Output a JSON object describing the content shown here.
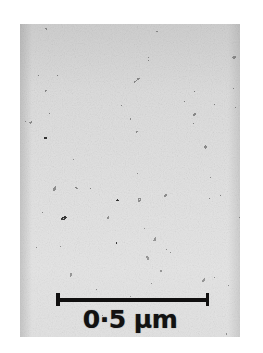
{
  "figure": {
    "kind": "electron-micrograph",
    "clipped_header_text": "",
    "plate": {
      "left": 20,
      "top": 24,
      "width": 220,
      "height": 313,
      "base_gray": "#b9b9b9",
      "grain_fill": "#c8c8c8",
      "boundary_color": "#3a3a3a",
      "precipitate_color": "#2e2e2e",
      "noise_opacity": 0.42,
      "grain_cell_size_px": 22
    },
    "scalebar": {
      "left": 56,
      "top": 293,
      "length_px": 153,
      "thickness_px": 3.5,
      "cap_height_px": 13,
      "color": "#100f0f",
      "label": "0·5 µm",
      "value": 0.5,
      "unit": "µm"
    }
  }
}
